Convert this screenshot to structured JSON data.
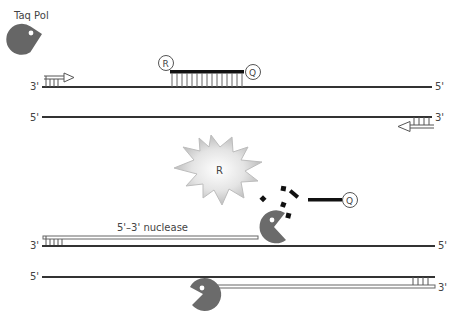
{
  "diagram": {
    "title": "Taq Pol",
    "colors": {
      "strand": "#333333",
      "primer_outline": "#555555",
      "probe": "#111111",
      "polymerase": "#6b6b6b",
      "burst_edge": "#c8c8c8",
      "burst_center": "#ffffff"
    },
    "panel1": {
      "top_strand": {
        "left_end": "3'",
        "right_end": "5'"
      },
      "bottom_strand": {
        "left_end": "5'",
        "right_end": "3'"
      },
      "probe": {
        "reporter": "R",
        "quencher": "Q"
      }
    },
    "panel2": {
      "released_reporter": "R",
      "released_quencher": "Q",
      "nuclease_label": "5'–3' nuclease",
      "top_strand": {
        "left_end": "3'",
        "right_end": "5'"
      },
      "bottom_strand": {
        "left_end": "5'",
        "right_end": "3'"
      }
    },
    "icons": {
      "polymerase": "pacman-enzyme-icon",
      "primer": "primer-arrow-icon",
      "burst": "fluorescence-burst-icon"
    }
  }
}
